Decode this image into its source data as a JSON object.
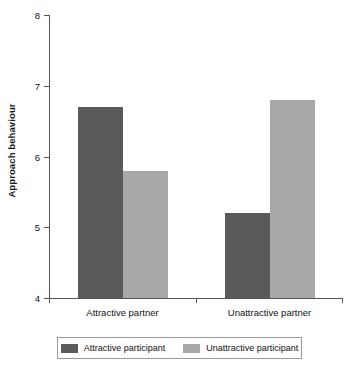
{
  "chart_data": {
    "type": "bar",
    "title": "",
    "xlabel": "",
    "ylabel": "Approach behaviour",
    "categories": [
      "Attractive partner",
      "Unattractive partner"
    ],
    "series": [
      {
        "name": "Attractive participant",
        "values": [
          6.7,
          5.2
        ],
        "color": "#5a5a5a"
      },
      {
        "name": "Unattractive participant",
        "values": [
          5.8,
          6.8
        ],
        "color": "#a8a8a8"
      }
    ],
    "ylim": [
      4,
      8
    ],
    "yticks": [
      4,
      5,
      6,
      7,
      8
    ],
    "ytick_labels": [
      "4",
      "5",
      "6",
      "7",
      "8"
    ],
    "grid": false,
    "legend_position": "bottom"
  },
  "axes": {
    "y_title": "Approach behaviour",
    "tick_labels": [
      "8",
      "7",
      "6",
      "5",
      "4"
    ]
  },
  "groups": [
    {
      "label": "Attractive partner"
    },
    {
      "label": "Unattractive partner"
    }
  ],
  "legend": {
    "entries": [
      {
        "label": "Attractive participant",
        "color": "#5a5a5a"
      },
      {
        "label": "Unattractive participant",
        "color": "#a8a8a8"
      }
    ]
  },
  "colors": {
    "series_dark": "#5a5a5a",
    "series_light": "#a8a8a8",
    "axis": "#555555",
    "legend_border": "#9a9a9a",
    "text": "#111111",
    "background": "#ffffff"
  }
}
